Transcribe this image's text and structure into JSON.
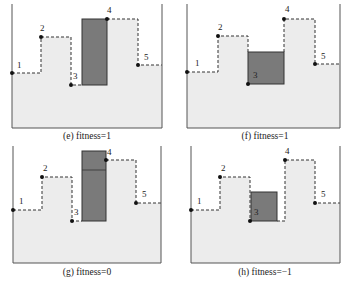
{
  "figure": {
    "colors": {
      "fill": "#ececec",
      "wall": "#555555",
      "box": "#7a7a7a",
      "box_stroke": "#333333",
      "dash": "#333333",
      "point": "#111111"
    },
    "panels": [
      {
        "id": "e",
        "caption": "(e) fitness=1",
        "fitness": 1,
        "walls": {
          "left": 12,
          "right": 162,
          "bottom": 128,
          "top": 4
        },
        "caption_pos": {
          "x": 87,
          "y": 139
        },
        "skyline": [
          [
            12,
            73
          ],
          [
            41,
            73
          ],
          [
            41,
            37
          ],
          [
            71,
            37
          ],
          [
            71,
            85
          ],
          [
            82,
            85
          ]
        ],
        "skyline_right": [
          [
            107,
            19
          ],
          [
            138,
            19
          ],
          [
            138,
            65
          ],
          [
            162,
            65
          ]
        ],
        "fill_top": [
          [
            12,
            73
          ],
          [
            41,
            73
          ],
          [
            41,
            37
          ],
          [
            71,
            37
          ],
          [
            71,
            85
          ],
          [
            82,
            85
          ],
          [
            82,
            19
          ],
          [
            138,
            19
          ],
          [
            138,
            65
          ],
          [
            162,
            65
          ]
        ],
        "boxes": [
          {
            "x": 82,
            "y": 19,
            "w": 25,
            "h": 66
          }
        ],
        "dividers": [],
        "points": [
          {
            "label": "1",
            "x": 12,
            "y": 73,
            "lx": 17,
            "ly": 68
          },
          {
            "label": "2",
            "x": 41,
            "y": 37,
            "lx": 40,
            "ly": 31
          },
          {
            "label": "3",
            "x": 71,
            "y": 85,
            "lx": 73,
            "ly": 79
          },
          {
            "label": "4",
            "x": 107,
            "y": 19,
            "lx": 107,
            "ly": 13
          },
          {
            "label": "5",
            "x": 138,
            "y": 65,
            "lx": 144,
            "ly": 60
          }
        ]
      },
      {
        "id": "f",
        "caption": "(f) fitness=1",
        "fitness": 1,
        "walls": {
          "left": 187,
          "right": 340,
          "bottom": 128,
          "top": 4
        },
        "caption_pos": {
          "x": 265,
          "y": 139
        },
        "skyline": [
          [
            187,
            72
          ],
          [
            218,
            72
          ],
          [
            218,
            36
          ],
          [
            248,
            36
          ],
          [
            248,
            52
          ]
        ],
        "skyline_right": [
          [
            284,
            52
          ],
          [
            284,
            19
          ],
          [
            315,
            19
          ],
          [
            315,
            64
          ],
          [
            340,
            64
          ]
        ],
        "fill_top": [
          [
            187,
            72
          ],
          [
            218,
            72
          ],
          [
            218,
            36
          ],
          [
            248,
            36
          ],
          [
            248,
            52
          ],
          [
            284,
            52
          ],
          [
            284,
            19
          ],
          [
            315,
            19
          ],
          [
            315,
            64
          ],
          [
            340,
            64
          ]
        ],
        "boxes": [
          {
            "x": 248,
            "y": 52,
            "w": 36,
            "h": 32
          }
        ],
        "dividers": [],
        "points": [
          {
            "label": "1",
            "x": 187,
            "y": 72,
            "lx": 195,
            "ly": 66
          },
          {
            "label": "2",
            "x": 218,
            "y": 36,
            "lx": 218,
            "ly": 30
          },
          {
            "label": "3",
            "x": 248,
            "y": 84,
            "lx": 253,
            "ly": 78
          },
          {
            "label": "4",
            "x": 284,
            "y": 19,
            "lx": 285,
            "ly": 12
          },
          {
            "label": "5",
            "x": 315,
            "y": 64,
            "lx": 321,
            "ly": 59
          }
        ]
      },
      {
        "id": "g",
        "caption": "(g) fitness=0",
        "fitness": 0,
        "walls": {
          "left": 13,
          "right": 161,
          "bottom": 263,
          "top": 146
        },
        "caption_pos": {
          "x": 87,
          "y": 275
        },
        "skyline": [
          [
            13,
            210
          ],
          [
            42,
            210
          ],
          [
            42,
            177
          ],
          [
            72,
            177
          ],
          [
            72,
            221
          ],
          [
            82,
            221
          ]
        ],
        "skyline_right": [
          [
            106,
            160
          ],
          [
            136,
            160
          ],
          [
            136,
            203
          ],
          [
            161,
            203
          ]
        ],
        "fill_top": [
          [
            13,
            210
          ],
          [
            42,
            210
          ],
          [
            42,
            177
          ],
          [
            72,
            177
          ],
          [
            72,
            221
          ],
          [
            82,
            221
          ],
          [
            82,
            160
          ],
          [
            136,
            160
          ],
          [
            136,
            203
          ],
          [
            161,
            203
          ]
        ],
        "boxes": [
          {
            "x": 82,
            "y": 151,
            "w": 24,
            "h": 70
          }
        ],
        "dividers": [
          {
            "x1": 82,
            "y1": 170,
            "x2": 106,
            "y2": 170
          }
        ],
        "points": [
          {
            "label": "1",
            "x": 13,
            "y": 210,
            "lx": 19,
            "ly": 204
          },
          {
            "label": "2",
            "x": 42,
            "y": 177,
            "lx": 43,
            "ly": 171
          },
          {
            "label": "3",
            "x": 72,
            "y": 221,
            "lx": 74,
            "ly": 215
          },
          {
            "label": "4",
            "x": 106,
            "y": 160,
            "lx": 107,
            "ly": 155
          },
          {
            "label": "5",
            "x": 136,
            "y": 203,
            "lx": 142,
            "ly": 197
          }
        ]
      },
      {
        "id": "h",
        "caption": "(h) fitness=−1",
        "fitness": -1,
        "walls": {
          "left": 191,
          "right": 340,
          "bottom": 263,
          "top": 146
        },
        "caption_pos": {
          "x": 265,
          "y": 275
        },
        "skyline": [
          [
            191,
            210
          ],
          [
            220,
            210
          ],
          [
            220,
            177
          ],
          [
            250,
            177
          ],
          [
            250,
            221
          ]
        ],
        "skyline_right": [
          [
            277,
            221
          ],
          [
            285,
            221
          ],
          [
            285,
            160
          ],
          [
            315,
            160
          ],
          [
            315,
            203
          ],
          [
            340,
            203
          ]
        ],
        "fill_top": [
          [
            191,
            210
          ],
          [
            220,
            210
          ],
          [
            220,
            177
          ],
          [
            250,
            177
          ],
          [
            250,
            221
          ],
          [
            285,
            221
          ],
          [
            285,
            160
          ],
          [
            315,
            160
          ],
          [
            315,
            203
          ],
          [
            340,
            203
          ]
        ],
        "boxes": [
          {
            "x": 251,
            "y": 192,
            "w": 26,
            "h": 29
          }
        ],
        "dividers": [],
        "points": [
          {
            "label": "1",
            "x": 191,
            "y": 210,
            "lx": 197,
            "ly": 204
          },
          {
            "label": "2",
            "x": 220,
            "y": 177,
            "lx": 221,
            "ly": 171
          },
          {
            "label": "3",
            "x": 250,
            "y": 221,
            "lx": 254,
            "ly": 215
          },
          {
            "label": "4",
            "x": 285,
            "y": 160,
            "lx": 285,
            "ly": 154
          },
          {
            "label": "5",
            "x": 315,
            "y": 203,
            "lx": 321,
            "ly": 197
          }
        ]
      }
    ]
  }
}
